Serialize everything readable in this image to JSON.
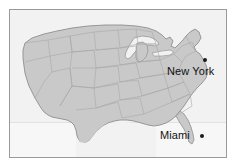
{
  "figure": {
    "kind": "map",
    "region": "Continental United States",
    "frame_color": "#9a9a9a",
    "background_color": "#f2f2f2",
    "land_fill_color": "#c9c9c9",
    "state_border_color": "#a8a8a8",
    "coastline_color": "#8f8f8f"
  },
  "cities": [
    {
      "name": "New York",
      "label": "New York",
      "marker": "city-dot",
      "marker_color": "#1a1a1a",
      "label_position": "below-left-of-dot"
    },
    {
      "name": "Miami",
      "label": "Miami",
      "marker": "city-dot",
      "marker_color": "#1a1a1a",
      "label_position": "left-of-dot"
    }
  ]
}
